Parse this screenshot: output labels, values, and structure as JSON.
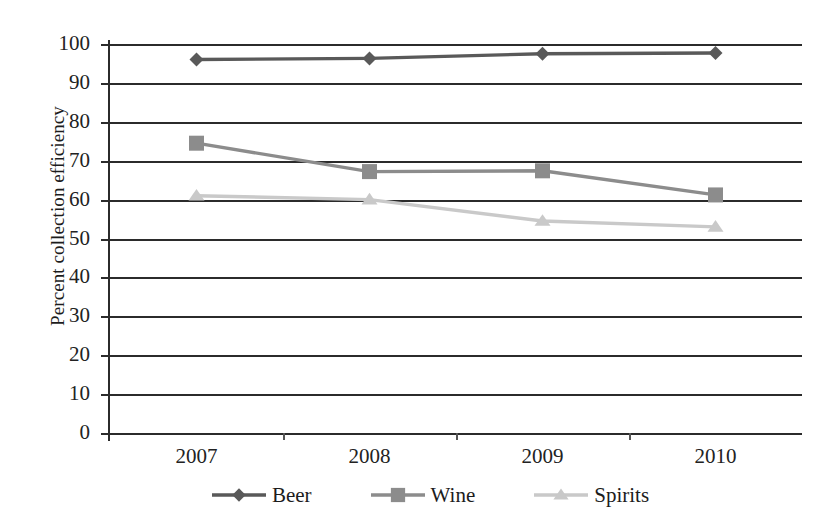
{
  "chart_data": {
    "type": "line",
    "title": "",
    "subtitle": "",
    "xlabel": "",
    "ylabel": "Percent collection efficiency",
    "categories": [
      "2007",
      "2008",
      "2009",
      "2010"
    ],
    "x": [
      2007,
      2008,
      2009,
      2010
    ],
    "ylim": [
      0,
      100
    ],
    "yticks": [
      0,
      10,
      20,
      30,
      40,
      50,
      60,
      70,
      80,
      90,
      100
    ],
    "ytick_labels": [
      "0",
      "10",
      "20",
      "30",
      "40",
      "50",
      "60",
      "70",
      "80",
      "90",
      "100"
    ],
    "grid": "horizontal",
    "legend_position": "bottom",
    "series": [
      {
        "name": "Beer",
        "marker": "diamond",
        "color": "#595959",
        "values": [
          96,
          96.3,
          97.5,
          97.7
        ]
      },
      {
        "name": "Wine",
        "marker": "square",
        "color": "#8c8c8c",
        "values": [
          74.5,
          67.2,
          67.4,
          61.2
        ]
      },
      {
        "name": "Spirits",
        "marker": "triangle",
        "color": "#c9c9c9",
        "values": [
          61,
          60,
          54.5,
          53
        ]
      }
    ]
  },
  "axis": {
    "tick_color": "#2b2b2b",
    "grid_color": "#2b2b2b"
  }
}
